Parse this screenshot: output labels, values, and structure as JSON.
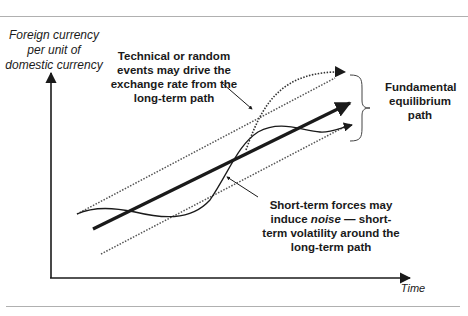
{
  "figure": {
    "y_axis_label": "Foreign currency per unit of domestic currency",
    "x_axis_label": "Time",
    "annotations": {
      "technical": "Technical or random events may drive the exchange rate from the long-term path",
      "fundamental": "Fundamental equilibrium path",
      "noise_before": "Short-term forces may induce ",
      "noise_italic": "noise",
      "noise_after": " — short-term volatility around the long-term path"
    },
    "lines": [
      {
        "name": "long-term path",
        "style": "thick solid arrow"
      },
      {
        "name": "upper band",
        "style": "dotted"
      },
      {
        "name": "lower band",
        "style": "dotted"
      },
      {
        "name": "short-term noise curve",
        "style": "thin solid arrow"
      },
      {
        "name": "technical deviation curve",
        "style": "dotted arrow"
      }
    ],
    "colors": {
      "ink": "#1a1a1a",
      "rule": "#b0b0b0",
      "dotted": "#555555"
    }
  }
}
